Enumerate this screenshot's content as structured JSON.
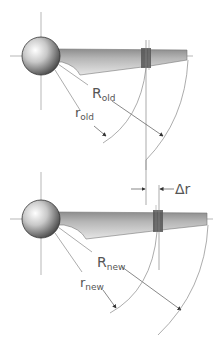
{
  "diagram": {
    "top": {
      "label_R": "R",
      "label_R_sub": "old",
      "label_r": "r",
      "label_r_sub": "old"
    },
    "bottom": {
      "label_R": "R",
      "label_R_sub": "new",
      "label_r": "r",
      "label_r_sub": "new",
      "delta_label": "Δr"
    },
    "colors": {
      "line": "#8a8a8a",
      "blade_light": "#d6d6d6",
      "blade_dark": "#9a9a9a",
      "band": "#555555",
      "text": "#555555"
    }
  }
}
